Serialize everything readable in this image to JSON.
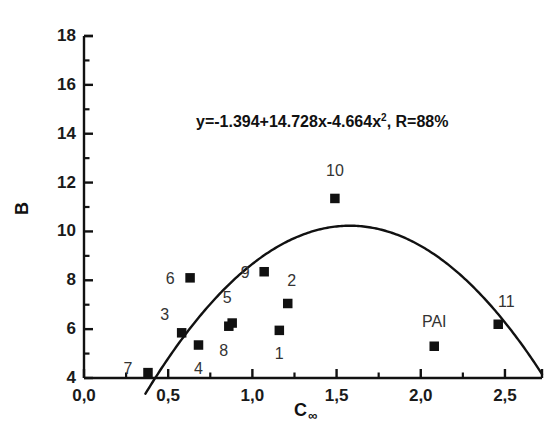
{
  "chart_data": {
    "type": "scatter",
    "title": "",
    "xlabel": "C∞",
    "xlabel_base": "C",
    "xlabel_sub": "∞",
    "ylabel": "B",
    "xlim": [
      0.0,
      2.72
    ],
    "ylim": [
      4,
      18
    ],
    "xticks": [
      0.0,
      0.5,
      1.0,
      1.5,
      2.0,
      2.5
    ],
    "xtick_labels": [
      "0,0",
      "0,5",
      "1,0",
      "1,5",
      "2,0",
      "2,5"
    ],
    "yticks": [
      4,
      6,
      8,
      10,
      12,
      14,
      16,
      18
    ],
    "ytick_labels": [
      "4",
      "6",
      "8",
      "10",
      "12",
      "14",
      "16",
      "18"
    ],
    "x_minor_step": 0.25,
    "y_minor_step": 1,
    "grid": false,
    "legend": null,
    "annotation": "y=-1.394+14.728x-4.664x², R=88%",
    "annotation_main": "y=-1.394+14.728x-4.664x",
    "annotation_exp": "2",
    "annotation_tail": ", R=88%",
    "fit": {
      "kind": "quadratic",
      "intercept": -1.394,
      "linear": 14.728,
      "quadratic": -4.664,
      "r_percent": 88,
      "x_start": 0.365,
      "x_end": 2.72
    },
    "points": [
      {
        "label": "1",
        "x": 1.16,
        "y": 5.95,
        "label_dx": 0,
        "label_dy": 24
      },
      {
        "label": "2",
        "x": 1.21,
        "y": 7.05,
        "label_dx": 4,
        "label_dy": -22
      },
      {
        "label": "3",
        "x": 0.58,
        "y": 5.85,
        "label_dx": -17,
        "label_dy": -18
      },
      {
        "label": "4",
        "x": 0.68,
        "y": 5.35,
        "label_dx": 0,
        "label_dy": 24
      },
      {
        "label": "5",
        "x": 0.88,
        "y": 6.25,
        "label_dx": -5,
        "label_dy": -25
      },
      {
        "label": "6",
        "x": 0.63,
        "y": 8.1,
        "label_dx": -20,
        "label_dy": 1
      },
      {
        "label": "7",
        "x": 0.38,
        "y": 4.22,
        "label_dx": -20,
        "label_dy": -4
      },
      {
        "label": "8",
        "x": 0.86,
        "y": 6.12,
        "label_dx": -5,
        "label_dy": 25
      },
      {
        "label": "9",
        "x": 1.07,
        "y": 8.35,
        "label_dx": -19,
        "label_dy": 1
      },
      {
        "label": "10",
        "x": 1.49,
        "y": 11.35,
        "label_dx": 0,
        "label_dy": -27
      },
      {
        "label": "11",
        "x": 2.46,
        "y": 6.2,
        "label_dx": 8,
        "label_dy": -22
      },
      {
        "label": "PAI",
        "x": 2.08,
        "y": 5.3,
        "label_dx": 0,
        "label_dy": -24
      }
    ],
    "colors": {
      "axis": "#111111",
      "marker": "#111111",
      "curve": "#111111",
      "text": "#1a1a1a",
      "background": "#ffffff"
    }
  }
}
